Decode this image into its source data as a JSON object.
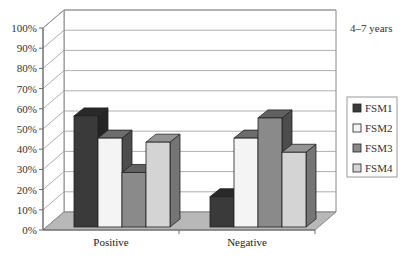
{
  "chart_data": {
    "type": "bar",
    "style": "3d-clustered-column",
    "title": "",
    "annotation": "4–7 years",
    "xlabel": "",
    "ylabel": "",
    "ylim": [
      0,
      100
    ],
    "ytick_step": 10,
    "yticks": [
      "0%",
      "10%",
      "20%",
      "30%",
      "40%",
      "50%",
      "60%",
      "70%",
      "80%",
      "90%",
      "100%"
    ],
    "categories": [
      "Positive",
      "Negative"
    ],
    "series": [
      {
        "name": "FSM1",
        "color": "#3a3a3a",
        "values": [
          55,
          15
        ]
      },
      {
        "name": "FSM2",
        "color": "#f4f4f4",
        "values": [
          44,
          44
        ]
      },
      {
        "name": "FSM3",
        "color": "#8a8a8a",
        "values": [
          27,
          54
        ]
      },
      {
        "name": "FSM4",
        "color": "#d4d4d4",
        "values": [
          42,
          37
        ]
      }
    ],
    "grid": true,
    "legend_position": "right"
  }
}
